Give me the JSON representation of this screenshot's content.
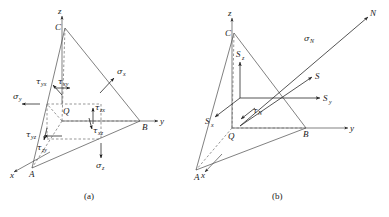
{
  "figure": {
    "background": "#ffffff",
    "ink": "#1a1a1a",
    "dash_color": "#6a6a6a",
    "line_color": "#4a4a4a"
  },
  "panels": [
    {
      "id": "a",
      "caption": "(a)",
      "axes": [
        {
          "name": "axis-label-z",
          "text": "z"
        },
        {
          "name": "axis-label-y",
          "text": "y"
        },
        {
          "name": "axis-label-x",
          "text": "x"
        }
      ],
      "vertices": [
        {
          "name": "vertex-label-c",
          "text": "C"
        },
        {
          "name": "vertex-label-b",
          "text": "B"
        },
        {
          "name": "vertex-label-a",
          "text": "A"
        },
        {
          "name": "point-label-q",
          "text": "Q"
        }
      ],
      "stresses": [
        {
          "name": "normal-stress-x",
          "symbol": "σ",
          "sub": "x"
        },
        {
          "name": "normal-stress-y",
          "symbol": "σ",
          "sub": "y"
        },
        {
          "name": "normal-stress-z",
          "symbol": "σ",
          "sub": "z"
        },
        {
          "name": "shear-stress-xy",
          "symbol": "τ",
          "sub": "xy"
        },
        {
          "name": "shear-stress-yx",
          "symbol": "τ",
          "sub": "yx"
        },
        {
          "name": "shear-stress-yz",
          "symbol": "τ",
          "sub": "yz"
        },
        {
          "name": "shear-stress-zy",
          "symbol": "τ",
          "sub": "zy"
        },
        {
          "name": "shear-stress-zx",
          "symbol": "τ",
          "sub": "zx"
        },
        {
          "name": "shear-stress-xz",
          "symbol": "τ",
          "sub": "xz"
        }
      ]
    },
    {
      "id": "b",
      "caption": "(b)",
      "axes": [
        {
          "name": "axis-label-z",
          "text": "z"
        },
        {
          "name": "axis-label-y",
          "text": "y"
        },
        {
          "name": "axis-label-x",
          "text": "x"
        }
      ],
      "vertices": [
        {
          "name": "vertex-label-c",
          "text": "C"
        },
        {
          "name": "vertex-label-b",
          "text": "B"
        },
        {
          "name": "vertex-label-a",
          "text": "A"
        },
        {
          "name": "point-label-q",
          "text": "Q"
        }
      ],
      "vectors": [
        {
          "name": "normal-direction-n",
          "symbol": "N",
          "sub": ""
        },
        {
          "name": "resultant-stress-s",
          "symbol": "S",
          "sub": ""
        },
        {
          "name": "stress-component-sx",
          "symbol": "S",
          "sub": "x"
        },
        {
          "name": "stress-component-sy",
          "symbol": "S",
          "sub": "y"
        },
        {
          "name": "stress-component-sz",
          "symbol": "S",
          "sub": "z"
        },
        {
          "name": "normal-stress-n",
          "symbol": "σ",
          "sub": "N"
        },
        {
          "name": "shear-stress-n",
          "symbol": "τ",
          "sub": "N"
        }
      ]
    }
  ],
  "labels": {
    "a": {
      "z": "z",
      "y": "y",
      "x": "x",
      "C": "C",
      "B": "B",
      "A": "A",
      "Q": "Q",
      "sigma": "σ",
      "tau": "τ",
      "sub_x": "x",
      "sub_y": "y",
      "sub_z": "z",
      "sub_xy": "xy",
      "sub_yx": "yx",
      "sub_yz": "yz",
      "sub_zy": "zy",
      "sub_zx": "zx",
      "sub_xz": "xz",
      "caption": "(a)"
    },
    "b": {
      "z": "z",
      "y": "y",
      "x": "x",
      "C": "C",
      "B": "B",
      "A": "A",
      "Q": "Q",
      "N": "N",
      "S": "S",
      "S_main": "S",
      "sigma": "σ",
      "tau": "τ",
      "sub_x": "x",
      "sub_y": "y",
      "sub_z": "z",
      "sub_N": "N",
      "caption": "(b)"
    }
  }
}
